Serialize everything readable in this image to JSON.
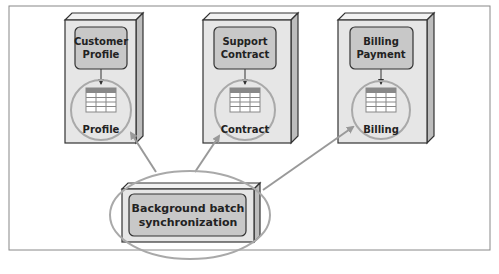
{
  "services": [
    {
      "name": "customer-profile",
      "line1": "Customer",
      "line2": "Profile",
      "db": "Profile"
    },
    {
      "name": "support-contract",
      "line1": "Support",
      "line2": "Contract",
      "db": "Contract"
    },
    {
      "name": "billing-payment",
      "line1": "Billing",
      "line2": "Payment",
      "db": "Billing"
    }
  ],
  "sync": {
    "line1": "Background batch",
    "line2": "synchronization"
  },
  "colors": {
    "frame": "#888888",
    "box_fill": "#e6e6e6",
    "inner_fill": "#c8c8c8",
    "ellipse": "#a9a9a9",
    "arrow": "#999999",
    "table_header": "#888888"
  }
}
